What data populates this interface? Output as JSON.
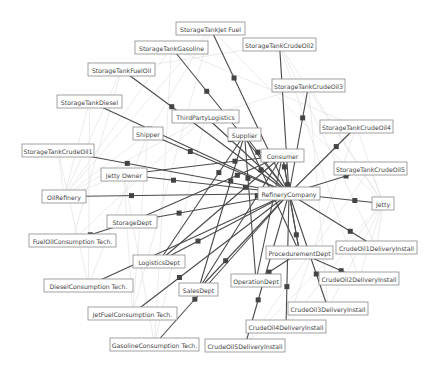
{
  "diagram": {
    "title": "",
    "nodes": [
      {
        "id": "RefineryCompany",
        "label": "RefineryCompany"
      },
      {
        "id": "Consumer",
        "label": "Consumer"
      },
      {
        "id": "Supplier",
        "label": "Supplier"
      },
      {
        "id": "ThirdPartyLogistics",
        "label": "ThirdPartyLogistics"
      },
      {
        "id": "Shipper",
        "label": "Shipper"
      },
      {
        "id": "JettyOwner",
        "label": "Jetty Owner"
      },
      {
        "id": "OilRefinery",
        "label": "OilRefinery"
      },
      {
        "id": "StorageDept",
        "label": "StorageDept"
      },
      {
        "id": "LogisticsDept",
        "label": "LogisticsDept"
      },
      {
        "id": "SalesDept",
        "label": "SalesDept"
      },
      {
        "id": "OperationDept",
        "label": "OperationDept"
      },
      {
        "id": "ProcedurementDept",
        "label": "ProcedurementDept"
      },
      {
        "id": "StorageTankJetFuel",
        "label": "StorageTankJet Fuel"
      },
      {
        "id": "StorageTankGasoline",
        "label": "StorageTankGasoline"
      },
      {
        "id": "StorageTankCrudeOil2",
        "label": "StorageTankCrudeOil2"
      },
      {
        "id": "StorageTankFuelOil",
        "label": "StorageTankFuelOil"
      },
      {
        "id": "StorageTankCrudeOil3",
        "label": "StorageTankCrudeOil3"
      },
      {
        "id": "StorageTankDiesel",
        "label": "StorageTankDiesel"
      },
      {
        "id": "StorageTankCrudeOil4",
        "label": "StorageTankCrudeOil4"
      },
      {
        "id": "StorageTankCrudeOil1",
        "label": "StorageTankCrudeOil1"
      },
      {
        "id": "StorageTankCrudeOil5",
        "label": "StorageTankCrudeOil5"
      },
      {
        "id": "Jetty",
        "label": "Jetty"
      },
      {
        "id": "CrudeOil1DeliveryInstall",
        "label": "CrudeOil1DeliveryInstall"
      },
      {
        "id": "CrudeOil2DeliveryInstall",
        "label": "CrudeOil2DeliveryInstall"
      },
      {
        "id": "CrudeOil3DeliveryInstall",
        "label": "CrudeOil3DeliveryInstall"
      },
      {
        "id": "CrudeOil4DeliveryInstall",
        "label": "CrudeOil4DeliveryInstall"
      },
      {
        "id": "CrudeOil5DeliveryInstall",
        "label": "CrudeOil5DeliveryInstall"
      },
      {
        "id": "FuelOilConsumptionTech",
        "label": "FuelOilConsumption Tech."
      },
      {
        "id": "DieselConsumptionTech",
        "label": "DieselConsumption Tech."
      },
      {
        "id": "JetFuelConsumptionTech",
        "label": "JetFuelConsumption Tech."
      },
      {
        "id": "GasolineConsumptionTech",
        "label": "GasolineConsumption Tech."
      }
    ],
    "edges_main": [
      [
        "StorageTankJetFuel",
        "RefineryCompany"
      ],
      [
        "StorageTankGasoline",
        "RefineryCompany"
      ],
      [
        "StorageTankCrudeOil2",
        "RefineryCompany"
      ],
      [
        "StorageTankFuelOil",
        "RefineryCompany"
      ],
      [
        "StorageTankCrudeOil3",
        "RefineryCompany"
      ],
      [
        "StorageTankDiesel",
        "RefineryCompany"
      ],
      [
        "StorageTankCrudeOil4",
        "RefineryCompany"
      ],
      [
        "StorageTankCrudeOil1",
        "RefineryCompany"
      ],
      [
        "StorageTankCrudeOil5",
        "RefineryCompany"
      ],
      [
        "JettyOwner",
        "RefineryCompany"
      ],
      [
        "OilRefinery",
        "RefineryCompany"
      ],
      [
        "Jetty",
        "RefineryCompany"
      ],
      [
        "StorageDept",
        "RefineryCompany"
      ],
      [
        "CrudeOil1DeliveryInstall",
        "RefineryCompany"
      ],
      [
        "LogisticsDept",
        "RefineryCompany"
      ],
      [
        "SalesDept",
        "RefineryCompany"
      ],
      [
        "OperationDept",
        "ProcedurementDept"
      ],
      [
        "CrudeOil2DeliveryInstall",
        "ProcedurementDept"
      ],
      [
        "CrudeOil3DeliveryInstall",
        "RefineryCompany"
      ],
      [
        "CrudeOil4DeliveryInstall",
        "RefineryCompany"
      ],
      [
        "CrudeOil5DeliveryInstall",
        "RefineryCompany"
      ],
      [
        "JetFuelConsumptionTech",
        "RefineryCompany"
      ],
      [
        "GasolineConsumptionTech",
        "RefineryCompany"
      ],
      [
        "FuelOilConsumptionTech",
        "StorageDept"
      ],
      [
        "DieselConsumptionTech",
        "RefineryCompany"
      ],
      [
        "Supplier",
        "RefineryCompany"
      ],
      [
        "Consumer",
        "RefineryCompany"
      ],
      [
        "Shipper",
        "RefineryCompany"
      ],
      [
        "ThirdPartyLogistics",
        "RefineryCompany"
      ],
      [
        "ProcedurementDept",
        "RefineryCompany"
      ],
      [
        "Supplier",
        "SalesDept"
      ],
      [
        "Supplier",
        "OperationDept"
      ],
      [
        "Supplier",
        "ProcedurementDept"
      ],
      [
        "Consumer",
        "StorageDept"
      ],
      [
        "Consumer",
        "LogisticsDept"
      ],
      [
        "Consumer",
        "SalesDept"
      ],
      [
        "Consumer",
        "OperationDept"
      ],
      [
        "Consumer",
        "JettyOwner"
      ],
      [
        "Supplier",
        "LogisticsDept"
      ],
      [
        "Consumer",
        "ProcedurementDept"
      ]
    ],
    "edges_background": [
      [
        "OilRefinery",
        "StorageTankFuelOil"
      ],
      [
        "OilRefinery",
        "StorageTankDiesel"
      ],
      [
        "OilRefinery",
        "StorageTankGasoline"
      ],
      [
        "OilRefinery",
        "StorageTankJetFuel"
      ],
      [
        "OilRefinery",
        "Shipper"
      ],
      [
        "OilRefinery",
        "ThirdPartyLogistics"
      ],
      [
        "OilRefinery",
        "StorageTankCrudeOil1"
      ],
      [
        "OilRefinery",
        "JettyOwner"
      ],
      [
        "Jetty",
        "StorageTankCrudeOil2"
      ],
      [
        "Jetty",
        "StorageTankCrudeOil3"
      ],
      [
        "Jetty",
        "StorageTankCrudeOil4"
      ],
      [
        "Jetty",
        "StorageTankCrudeOil5"
      ],
      [
        "Jetty",
        "CrudeOil1DeliveryInstall"
      ],
      [
        "Jetty",
        "CrudeOil2DeliveryInstall"
      ],
      [
        "Jetty",
        "CrudeOil3DeliveryInstall"
      ],
      [
        "Jetty",
        "CrudeOil4DeliveryInstall"
      ],
      [
        "Jetty",
        "CrudeOil5DeliveryInstall"
      ],
      [
        "Jetty",
        "StorageTankJetFuel"
      ],
      [
        "StorageTankFuelOil",
        "FuelOilConsumptionTech"
      ],
      [
        "StorageTankDiesel",
        "DieselConsumptionTech"
      ],
      [
        "StorageTankJetFuel",
        "JetFuelConsumptionTech"
      ],
      [
        "StorageTankGasoline",
        "GasolineConsumptionTech"
      ],
      [
        "Shipper",
        "DieselConsumptionTech"
      ],
      [
        "Shipper",
        "JetFuelConsumptionTech"
      ],
      [
        "ThirdPartyLogistics",
        "GasolineConsumptionTech"
      ],
      [
        "ThirdPartyLogistics",
        "FuelOilConsumptionTech"
      ],
      [
        "JettyOwner",
        "GasolineConsumptionTech"
      ],
      [
        "JettyOwner",
        "JetFuelConsumptionTech"
      ],
      [
        "StorageTankCrudeOil1",
        "DieselConsumptionTech"
      ],
      [
        "StorageTankCrudeOil3",
        "CrudeOil3DeliveryInstall"
      ],
      [
        "StorageTankCrudeOil2",
        "CrudeOil2DeliveryInstall"
      ],
      [
        "StorageTankCrudeOil4",
        "CrudeOil4DeliveryInstall"
      ],
      [
        "StorageTankCrudeOil5",
        "CrudeOil5DeliveryInstall"
      ],
      [
        "StorageTankCrudeOil2",
        "CrudeOil1DeliveryInstall"
      ],
      [
        "Shipper",
        "StorageTankJetFuel"
      ],
      [
        "ThirdPartyLogistics",
        "StorageTankCrudeOil3"
      ],
      [
        "StorageTankGasoline",
        "StorageTankCrudeOil4"
      ],
      [
        "StorageTankFuelOil",
        "StorageTankCrudeOil2"
      ]
    ]
  }
}
